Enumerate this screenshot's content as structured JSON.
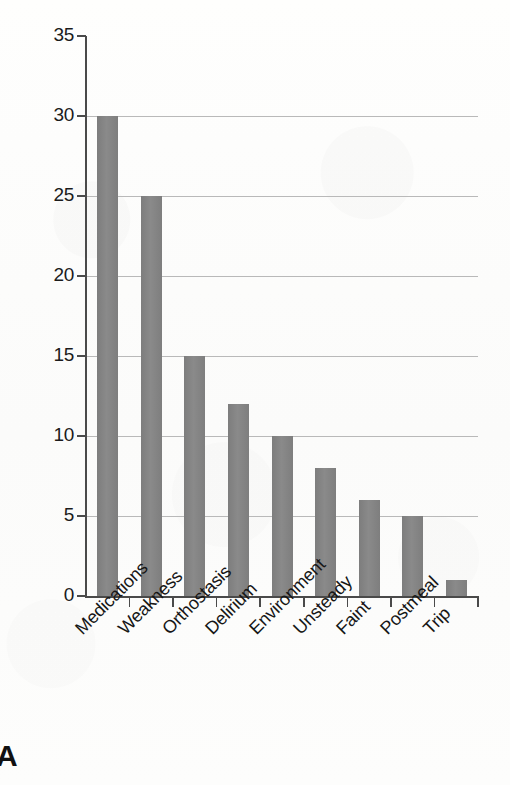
{
  "panel": {
    "letter": "A"
  },
  "chart_data": {
    "type": "bar",
    "title": "",
    "subtitle": "",
    "xlabel": "",
    "ylabel": "",
    "categories": [
      "Medications",
      "Weakness",
      "Orthostasis",
      "Delirium",
      "Environment",
      "Unsteady",
      "Faint",
      "Postmeal",
      "Trip"
    ],
    "values": [
      30,
      25,
      15,
      12,
      10,
      8,
      6,
      5,
      1
    ],
    "ylim": [
      0,
      35
    ],
    "ytick_labels": [
      "0",
      "5",
      "10",
      "15",
      "20",
      "25",
      "30",
      "35"
    ],
    "ytick_values": [
      0,
      5,
      10,
      15,
      20,
      25,
      30,
      35
    ],
    "ytick_interval": 5,
    "grid": "horizontal",
    "legend": "none",
    "bar_color": "#828282",
    "grid_color": "#b9b9b9",
    "axis_color": "#4a4a4a",
    "background_color": "#fdfdfc",
    "xtick_label_rotation": -45
  }
}
